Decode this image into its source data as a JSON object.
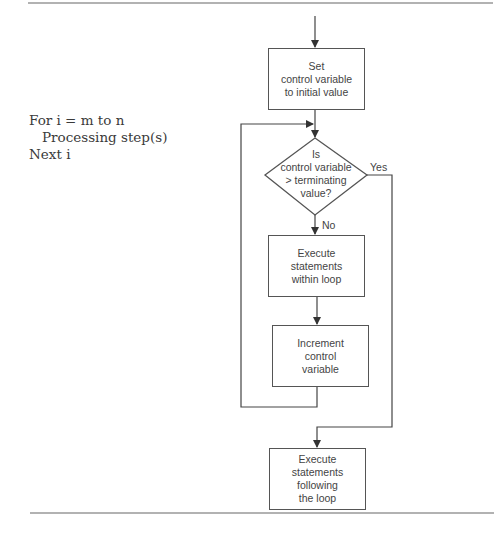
{
  "pseudocode": {
    "lines": [
      "For i = m to n",
      "Processing step(s)",
      "Next i"
    ]
  },
  "flowchart": {
    "start_box": {
      "lines": [
        "Set",
        "control variable",
        "to initial value"
      ]
    },
    "decision": {
      "lines": [
        "Is",
        "control variable",
        "> terminating",
        "value?"
      ]
    },
    "yes_label": "Yes",
    "no_label": "No",
    "loop_body_box": {
      "lines": [
        "Execute",
        "statements",
        "within loop"
      ]
    },
    "increment_box": {
      "lines": [
        "Increment",
        "control",
        "variable"
      ]
    },
    "exit_box": {
      "lines": [
        "Execute",
        "statements",
        "following",
        "the loop"
      ]
    }
  },
  "colors": {
    "line": "#555555",
    "text": "#444444",
    "background": "#ffffff"
  }
}
